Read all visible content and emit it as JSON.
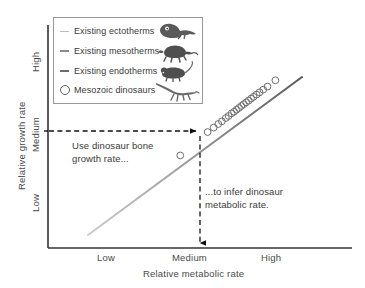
{
  "chart_data": {
    "type": "scatter",
    "title": "",
    "xlabel": "Relative metabolic rate",
    "ylabel": "Relative growth rate",
    "x_tick_labels": [
      "Low",
      "Medium",
      "High"
    ],
    "y_tick_labels": [
      "Low",
      "Medium",
      "High"
    ],
    "grid": false,
    "legend_position": "top-left",
    "xlim": [
      0,
      1
    ],
    "ylim": [
      0,
      1
    ],
    "series": [
      {
        "name": "Existing ectotherms",
        "type": "line",
        "color": "#bdbdbd",
        "swatch": "line",
        "icon": "lizard-icon"
      },
      {
        "name": "Existing mesotherms",
        "type": "line",
        "color": "#8a8a8a",
        "swatch": "line",
        "icon": "turtle-icon"
      },
      {
        "name": "Existing endotherms",
        "type": "line",
        "color": "#6b6b6b",
        "swatch": "line",
        "icon": "mouse-icon"
      },
      {
        "name": "Mesozoic dinosaurs",
        "type": "scatter",
        "color": "#6e6e6e",
        "swatch": "circle",
        "icon": "dinosaur-icon"
      }
    ],
    "trend_line": {
      "name": "metabolic-growth trend",
      "start": {
        "x": 0.18,
        "y": 0.13
      },
      "end": {
        "x": 0.9,
        "y": 0.92
      },
      "gradient_from": "#c9c9c9",
      "gradient_to": "#5e5e5e"
    },
    "dinosaur_points": [
      {
        "x": 0.435,
        "y": 0.415
      },
      {
        "x": 0.525,
        "y": 0.52
      },
      {
        "x": 0.545,
        "y": 0.54
      },
      {
        "x": 0.56,
        "y": 0.556
      },
      {
        "x": 0.572,
        "y": 0.568
      },
      {
        "x": 0.585,
        "y": 0.583
      },
      {
        "x": 0.594,
        "y": 0.592
      },
      {
        "x": 0.604,
        "y": 0.604
      },
      {
        "x": 0.612,
        "y": 0.611
      },
      {
        "x": 0.62,
        "y": 0.62
      },
      {
        "x": 0.628,
        "y": 0.628
      },
      {
        "x": 0.636,
        "y": 0.637
      },
      {
        "x": 0.644,
        "y": 0.645
      },
      {
        "x": 0.652,
        "y": 0.653
      },
      {
        "x": 0.66,
        "y": 0.661
      },
      {
        "x": 0.668,
        "y": 0.67
      },
      {
        "x": 0.676,
        "y": 0.678
      },
      {
        "x": 0.686,
        "y": 0.688
      },
      {
        "x": 0.696,
        "y": 0.698
      },
      {
        "x": 0.708,
        "y": 0.71
      },
      {
        "x": 0.722,
        "y": 0.724
      },
      {
        "x": 0.748,
        "y": 0.752
      }
    ],
    "annotations": [
      {
        "id": "growth-rate-note",
        "text": "Use dinosaur bone\ngrowth rate...",
        "arrow": "horizontal-dashed-right",
        "from": {
          "x": 0.0,
          "y": 0.6
        },
        "to": {
          "x": 0.605,
          "y": 0.6
        }
      },
      {
        "id": "metabolic-rate-note",
        "text": "...to infer dinosaur\nmetabolic rate.",
        "arrow": "vertical-dashed-down",
        "from": {
          "x": 0.605,
          "y": 0.6
        },
        "to": {
          "x": 0.605,
          "y": 0.0
        }
      }
    ]
  },
  "axes": {
    "x": {
      "title": "Relative metabolic rate",
      "ticks": {
        "low": "Low",
        "medium": "Medium",
        "high": "High"
      }
    },
    "y": {
      "title": "Relative growth rate",
      "ticks": {
        "low": "Low",
        "medium": "Medium",
        "high": "High"
      }
    }
  },
  "legend": {
    "entries": [
      {
        "label": "Existing ectotherms",
        "swatch_color": "#bdbdbd",
        "icon_name": "lizard-icon"
      },
      {
        "label": "Existing mesotherms",
        "swatch_color": "#8a8a8a",
        "icon_name": "turtle-icon"
      },
      {
        "label": "Existing endotherms",
        "swatch_color": "#6b6b6b",
        "icon_name": "mouse-icon"
      },
      {
        "label": "Mesozoic dinosaurs",
        "swatch_color": "#5e5e5e",
        "icon_name": "dinosaur-icon"
      }
    ]
  },
  "annotations": {
    "growth_note": "Use dinosaur bone\ngrowth rate...",
    "metabolic_note": "...to infer dinosaur\nmetabolic rate."
  },
  "colors": {
    "axis": "#333333",
    "text": "#3a3a3a",
    "legend_border": "#9a9a9a",
    "dashed_arrow": "#111111",
    "marker_stroke": "#6e6e6e"
  }
}
